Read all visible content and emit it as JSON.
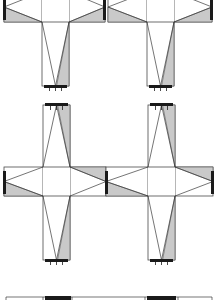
{
  "figure": {
    "colors": {
      "shade": "#c9c9c9",
      "line": "#3a3a3a",
      "cap": "#1a1a1a",
      "background": "#ffffff"
    },
    "rows": [
      {
        "name": "row-1",
        "stem_direction": "down",
        "arm_top": -8,
        "arm_bottom": 22,
        "stem_end": 86,
        "crosses": [
          {
            "name": "cross-top-left",
            "stem_left": 42,
            "stem_right": 69,
            "arm_left": 4,
            "arm_right": 105,
            "left_cap": true,
            "right_cap": true
          },
          {
            "name": "cross-top-right",
            "stem_left": 147,
            "stem_right": 174,
            "arm_left": 108,
            "arm_right": 212,
            "left_cap": false,
            "right_cap": true
          }
        ]
      },
      {
        "name": "row-2",
        "stem_direction": "up",
        "arm_top": 167,
        "arm_bottom": 196,
        "stem_end": 105,
        "crosses": [
          {
            "name": "cross-mid-left",
            "stem_left": 43,
            "stem_right": 70,
            "arm_left": 4,
            "arm_right": 106,
            "left_cap": true,
            "right_cap": false
          },
          {
            "name": "cross-mid-right",
            "stem_left": 148,
            "stem_right": 175,
            "arm_left": 106,
            "arm_right": 213,
            "left_cap": true,
            "right_cap": true
          }
        ]
      },
      {
        "name": "row-2-lower-stems",
        "stem_direction": "down",
        "arm_top": 196,
        "arm_bottom": 196,
        "stem_end": 260,
        "crosses": [
          {
            "name": "stem-mid-left-lower",
            "stem_left": 43,
            "stem_right": 70,
            "arm_left": 43,
            "arm_right": 70,
            "left_cap": false,
            "right_cap": false
          },
          {
            "name": "stem-mid-right-lower",
            "stem_left": 148,
            "stem_right": 175,
            "arm_left": 148,
            "arm_right": 175,
            "left_cap": false,
            "right_cap": false
          }
        ]
      }
    ],
    "bottom_partial": {
      "y": 297,
      "blobs": [
        {
          "x1": 45,
          "x2": 71
        },
        {
          "x1": 147,
          "x2": 176
        }
      ],
      "segments": [
        6,
        43,
        72,
        145,
        178,
        212
      ]
    }
  }
}
